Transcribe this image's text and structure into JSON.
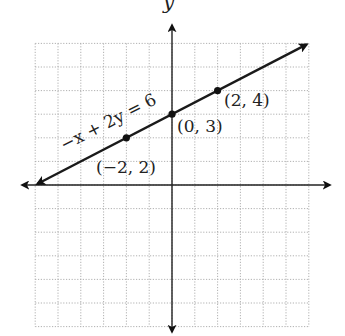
{
  "chart_data": {
    "type": "line",
    "title": "",
    "xlabel": "",
    "ylabel": "y",
    "xlim": [
      -6,
      6
    ],
    "ylim": [
      -6,
      6
    ],
    "grid": true,
    "grid_style": "dotted",
    "grid_step": 1,
    "tick_labels_shown": false,
    "series": [
      {
        "name": "-x + 2y = 6",
        "equation": "-x + 2y = 6",
        "slope": 0.5,
        "intercept": 3,
        "x": [
          -6,
          6
        ],
        "y": [
          0,
          6
        ],
        "arrows_both_ends": true
      }
    ],
    "points": [
      {
        "x": -2,
        "y": 2,
        "label": "(−2, 2)"
      },
      {
        "x": 0,
        "y": 3,
        "label": "(0, 3)"
      },
      {
        "x": 2,
        "y": 4,
        "label": "(2, 4)"
      }
    ],
    "annotations": [
      {
        "text": "−x + 2y = 6",
        "position": "along line, upper-left of y-axis",
        "rotation_deg": -27
      }
    ]
  },
  "labels": {
    "y_axis": "y",
    "equation": "−x + 2y = 6",
    "point_a": "(−2, 2)",
    "point_b": "(0, 3)",
    "point_c": "(2, 4)"
  },
  "colors": {
    "line": "#1a1a1a",
    "axis": "#222222",
    "grid": "#a8a8a8",
    "background": "#ffffff"
  }
}
